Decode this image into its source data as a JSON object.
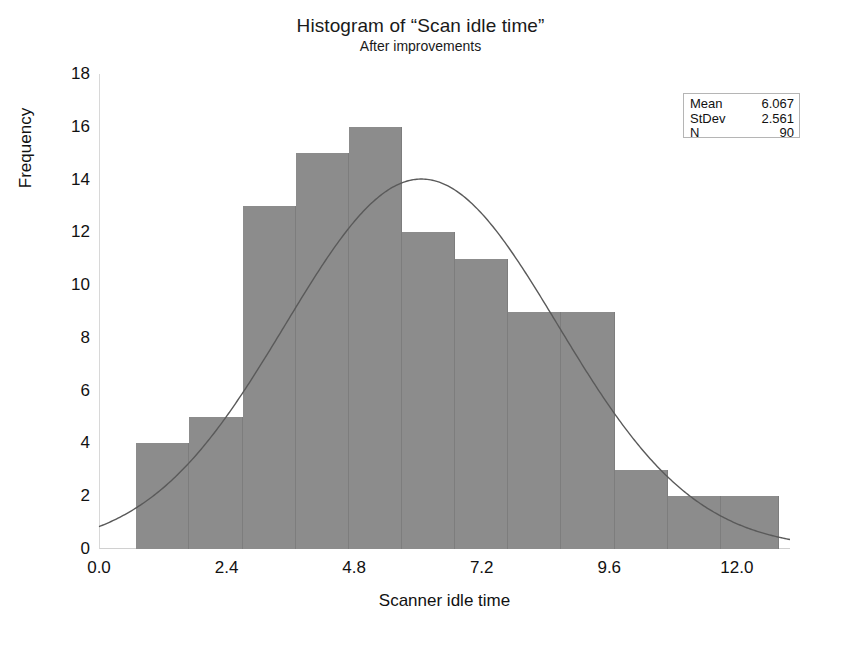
{
  "chart_data": {
    "type": "bar",
    "title": "Histogram of “Scan idle time”",
    "subtitle": "After improvements",
    "xlabel": "Scanner idle time",
    "ylabel": "Frequency",
    "xlim": [
      0.0,
      13.0
    ],
    "ylim": [
      0,
      18
    ],
    "grid": false,
    "bin_width": 1.0,
    "bin_starts": [
      0.7,
      1.7,
      2.7,
      3.7,
      4.7,
      5.7,
      6.7,
      7.7,
      8.7,
      9.7,
      10.7,
      11.7
    ],
    "categories": [
      "0.7-1.7",
      "1.7-2.7",
      "2.7-3.7",
      "3.7-4.7",
      "4.7-5.7",
      "5.7-6.7",
      "6.7-7.7",
      "7.7-8.7",
      "8.7-9.7",
      "9.7-10.7",
      "10.7-11.7",
      "11.7-12.8"
    ],
    "values": [
      4,
      5,
      13,
      15,
      16,
      12,
      11,
      9,
      9,
      3,
      2,
      2
    ],
    "xticks": [
      "0.0",
      "2.4",
      "4.8",
      "7.2",
      "9.6",
      "12.0"
    ],
    "xtick_values": [
      0.0,
      2.4,
      4.8,
      7.2,
      9.6,
      12.0
    ],
    "yticks": [
      "0",
      "2",
      "4",
      "6",
      "8",
      "10",
      "12",
      "14",
      "16",
      "18"
    ],
    "ytick_values": [
      0,
      2,
      4,
      6,
      8,
      10,
      12,
      14,
      16,
      18
    ],
    "overlay": {
      "type": "normal-curve",
      "mean": 6.067,
      "stdev": 2.561,
      "n": 90,
      "color": "#5a5a5a"
    },
    "bar_color": "#8c8c8c",
    "legend_position": "top-right"
  },
  "stats_box": {
    "rows": [
      {
        "label": "Mean",
        "value": "6.067"
      },
      {
        "label": "StDev",
        "value": "2.561"
      },
      {
        "label": "N",
        "value": "90"
      }
    ]
  }
}
